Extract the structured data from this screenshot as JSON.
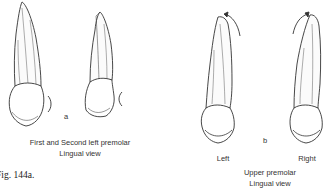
{
  "figure_label": "Fig. 144a.",
  "panel_a": {
    "letter": "a",
    "caption_line1": "First and Second left premolar",
    "caption_line2": "Lingual view",
    "teeth": [
      "first-left-premolar",
      "second-left-premolar"
    ]
  },
  "panel_b": {
    "letter": "b",
    "left_label": "Left",
    "right_label": "Right",
    "caption_line1": "Upper premolar",
    "caption_line2": "Lingual view",
    "teeth": [
      "upper-premolar-left",
      "upper-premolar-right"
    ]
  },
  "colors": {
    "ink": "#333333",
    "background": "#ffffff"
  }
}
